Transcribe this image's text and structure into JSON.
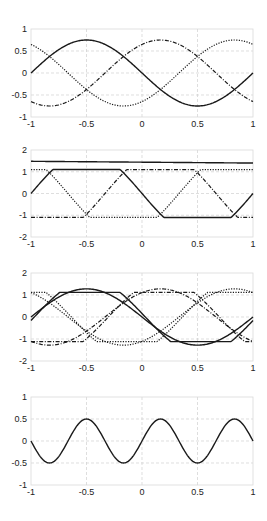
{
  "figure": {
    "width": 267,
    "height": 521,
    "background": "#ffffff",
    "frame_color": "#d9d9d9",
    "grid_color": "#d0d0d0",
    "line_color": "#1a1a1a"
  },
  "chart_data": [
    {
      "type": "line",
      "title": "",
      "xlabel": "",
      "ylabel": "",
      "xlim": [
        -1,
        1
      ],
      "ylim": [
        -1,
        1
      ],
      "xticks": [
        -1,
        -0.5,
        0,
        0.5,
        1
      ],
      "xtick_labels": [
        "-1",
        "-0.5",
        "0",
        "0.5",
        "1"
      ],
      "yticks": [
        -1,
        -0.5,
        0,
        0.5,
        1
      ],
      "ytick_labels": [
        "-1",
        "-0.5",
        "0",
        "0.5",
        "1"
      ],
      "grid": true,
      "box": {
        "left": 31,
        "top": 29,
        "right": 253,
        "bottom": 117
      },
      "series": [
        {
          "name": "phase a",
          "style": "solid",
          "func": "sine",
          "amp": -0.75,
          "freq": 1,
          "shift": 0
        },
        {
          "name": "phase b",
          "style": "dotted",
          "func": "sine",
          "amp": -0.75,
          "freq": 1,
          "shift": -0.6667
        },
        {
          "name": "phase c",
          "style": "dashdot",
          "func": "sine",
          "amp": -0.75,
          "freq": 1,
          "shift": 0.6667
        }
      ]
    },
    {
      "type": "line",
      "title": "",
      "xlabel": "",
      "ylabel": "",
      "xlim": [
        -1,
        1
      ],
      "ylim": [
        -2,
        2
      ],
      "xticks": [
        -1,
        -0.5,
        0,
        0.5,
        1
      ],
      "xtick_labels": [
        "-1",
        "-0.5",
        "0",
        "0.5",
        "1"
      ],
      "yticks": [
        -2,
        -1,
        0,
        1,
        2
      ],
      "ytick_labels": [
        "-2",
        "-1",
        "0",
        "1",
        "2"
      ],
      "grid": true,
      "box": {
        "left": 31,
        "top": 150,
        "right": 253,
        "bottom": 237
      },
      "series": [
        {
          "name": "level",
          "style": "solid",
          "func": "linear",
          "y0": 1.48,
          "y1": 1.4
        },
        {
          "name": "phase a",
          "style": "solid",
          "func": "clipsine",
          "amp": -1.9,
          "freq": 1,
          "shift": 0,
          "clip": 1.1
        },
        {
          "name": "phase b",
          "style": "dotted",
          "func": "clipsine",
          "amp": -1.9,
          "freq": 1,
          "shift": -0.6667,
          "clip": 1.1
        },
        {
          "name": "phase c",
          "style": "dashdot",
          "func": "clipsine",
          "amp": -1.9,
          "freq": 1,
          "shift": 0.6667,
          "clip": 1.1
        }
      ]
    },
    {
      "type": "line",
      "title": "",
      "xlabel": "",
      "ylabel": "",
      "xlim": [
        -1,
        1
      ],
      "ylim": [
        -2,
        2
      ],
      "xticks": [
        -1,
        -0.5,
        0,
        0.5,
        1
      ],
      "xtick_labels": [
        "-1",
        "-0.5",
        "0",
        "0.5",
        "1"
      ],
      "yticks": [
        -2,
        -1,
        0,
        1,
        2
      ],
      "ytick_labels": [
        "-2",
        "-1",
        "0",
        "1",
        "2"
      ],
      "grid": true,
      "box": {
        "left": 31,
        "top": 273,
        "right": 253,
        "bottom": 361
      },
      "series": [
        {
          "name": "phase a (sine)",
          "style": "solid",
          "func": "sine",
          "amp": -1.28,
          "freq": 1,
          "shift": 0
        },
        {
          "name": "phase a (clipped)",
          "style": "solid",
          "func": "clipsine",
          "amp": -1.7,
          "freq": 1,
          "shift": 0.03,
          "clip": 1.12
        },
        {
          "name": "phase b (sine)",
          "style": "dotted",
          "func": "sine",
          "amp": -1.28,
          "freq": 1,
          "shift": -0.6667
        },
        {
          "name": "phase b (clipped)",
          "style": "dotted",
          "func": "clipsine",
          "amp": -1.7,
          "freq": 1,
          "shift": -0.6367,
          "clip": 1.12
        },
        {
          "name": "phase c (sine)",
          "style": "dashdot",
          "func": "sine",
          "amp": -1.28,
          "freq": 1,
          "shift": 0.6667
        },
        {
          "name": "phase c (clipped)",
          "style": "dashdot",
          "func": "clipsine",
          "amp": -1.7,
          "freq": 1,
          "shift": 0.6967,
          "clip": 1.12
        }
      ]
    },
    {
      "type": "line",
      "title": "",
      "xlabel": "",
      "ylabel": "",
      "xlim": [
        -1,
        1
      ],
      "ylim": [
        -1,
        1
      ],
      "xticks": [
        -1,
        -0.5,
        0,
        0.5,
        1
      ],
      "xtick_labels": [
        "-1",
        "-0.5",
        "0",
        "0.5",
        "1"
      ],
      "yticks": [
        -1,
        -0.5,
        0,
        0.5,
        1
      ],
      "ytick_labels": [
        "-1",
        "-0.5",
        "0",
        "0.5",
        "1"
      ],
      "grid": true,
      "box": {
        "left": 31,
        "top": 397,
        "right": 253,
        "bottom": 485
      },
      "series": [
        {
          "name": "ripple",
          "style": "solid",
          "func": "sine",
          "amp": 0.5,
          "freq": 3,
          "shift": 0
        }
      ]
    }
  ]
}
